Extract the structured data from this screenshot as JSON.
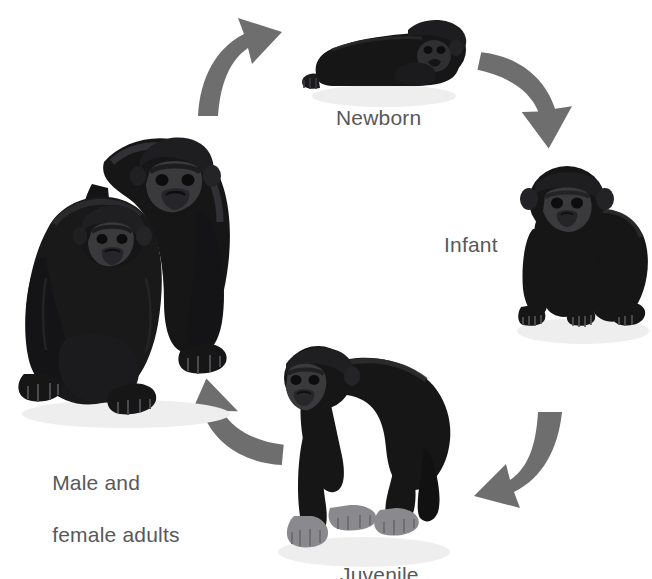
{
  "diagram": {
    "background_color": "#ffffff",
    "arrow_color": "#6e6e6e",
    "label_color": "#58585a",
    "body_color": "#161616",
    "fur_highlight_color": "#2b2b2d",
    "face_color": "#3a3a3c",
    "skin_color": "#8a8a8e",
    "shadow_color": "#eeeeee"
  },
  "labels": {
    "newborn": "Newborn",
    "infant": "Infant",
    "juvenile": "Juvenile",
    "adults_line1": "Male and",
    "adults_line2": "female adults"
  },
  "stages": [
    {
      "id": "newborn",
      "label": "Newborn",
      "position": "top",
      "pose": "lying-on-belly"
    },
    {
      "id": "infant",
      "label": "Infant",
      "position": "right",
      "pose": "standing-quadruped-front"
    },
    {
      "id": "juvenile",
      "label": "Juvenile",
      "position": "bottom",
      "pose": "knuckle-walking-left"
    },
    {
      "id": "adults",
      "label": "Male and female adults",
      "position": "left",
      "pose": "male-standing-female-sitting"
    }
  ],
  "arrows": [
    {
      "id": "adults-to-newborn",
      "from": "adults",
      "to": "newborn",
      "direction": "up-right"
    },
    {
      "id": "newborn-to-infant",
      "from": "newborn",
      "to": "infant",
      "direction": "down-right"
    },
    {
      "id": "infant-to-juvenile",
      "from": "infant",
      "to": "juvenile",
      "direction": "down-left"
    },
    {
      "id": "juvenile-to-adults",
      "from": "juvenile",
      "to": "adults",
      "direction": "up-left"
    }
  ]
}
